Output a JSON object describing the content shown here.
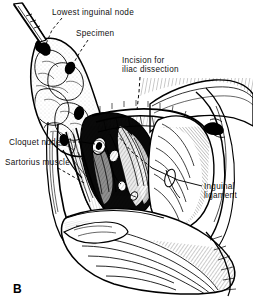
{
  "figure": {
    "letter": "B",
    "style": "black-and-white pen-and-ink medical line drawing",
    "background_color": "#ffffff",
    "ink_color": "#000000",
    "width": 253,
    "height": 306
  },
  "labels": [
    {
      "id": "lowest-inguinal-node",
      "text": "Lowest inguinal node",
      "lines": [
        "Lowest inguinal node"
      ],
      "x": 52,
      "y": 8,
      "leader": "dashed",
      "points_to": "forceps-held node at top of specimen"
    },
    {
      "id": "specimen",
      "text": "Specimen",
      "lines": [
        "Specimen"
      ],
      "x": 76,
      "y": 29,
      "leader": "dashed",
      "points_to": "reflected lymphatic fatty tissue mass"
    },
    {
      "id": "incision-for-iliac-dissection",
      "text": "Incision for iliac dissection",
      "lines": [
        "Incision for",
        "iliac dissection"
      ],
      "x": 122,
      "y": 56,
      "leader": "dashed-vertical",
      "points_to": "transverse incision above inguinal ligament"
    },
    {
      "id": "cloquet-node",
      "text": "Cloquet node",
      "lines": [
        "Cloquet node"
      ],
      "x": 9,
      "y": 138,
      "leader": "solid-dash",
      "points_to": "deep inguinal node at femoral canal"
    },
    {
      "id": "sartorius-muscle",
      "text": "Sartorius muscle",
      "lines": [
        "Sartorius muscle"
      ],
      "x": 5,
      "y": 158,
      "leader": "dashed",
      "points_to": "lateral border muscle of femoral triangle"
    },
    {
      "id": "inguinal-ligament",
      "text": "Inguinal ligament",
      "lines": [
        "Inguinal",
        "ligament"
      ],
      "x": 204,
      "y": 182,
      "leader": "solid",
      "points_to": "inguinal ligament band"
    }
  ]
}
